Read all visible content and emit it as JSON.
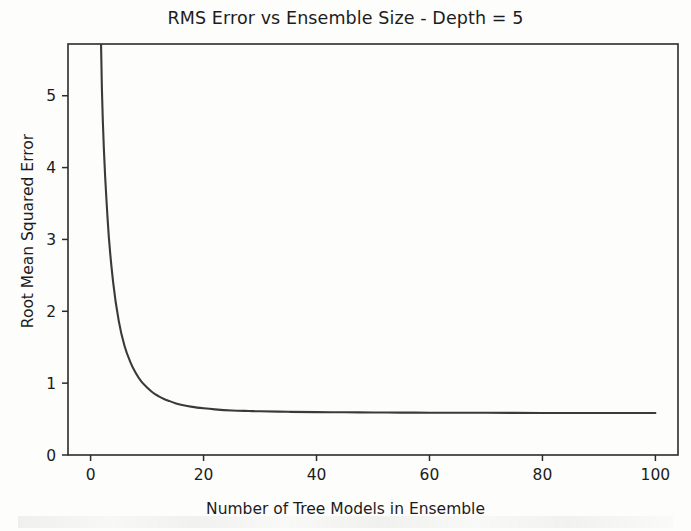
{
  "chart_data": {
    "type": "line",
    "title": "RMS Error vs Ensemble Size - Depth = 5",
    "xlabel": "Number of Tree Models in Ensemble",
    "ylabel": "Root Mean Squared Error",
    "xlim": [
      -4,
      104
    ],
    "ylim": [
      0,
      5.72
    ],
    "xticks": [
      0,
      20,
      40,
      60,
      80,
      100
    ],
    "xtick_labels": [
      "0",
      "20",
      "40",
      "60",
      "80",
      "100"
    ],
    "yticks": [
      0,
      1,
      2,
      3,
      4,
      5
    ],
    "ytick_labels": [
      "0",
      "1",
      "2",
      "3",
      "4",
      "5"
    ],
    "grid": false,
    "legend": null,
    "series": [
      {
        "name": "RMS Error",
        "color": "#3a3a3a",
        "linewidth": 2.1,
        "x": [
          1,
          2,
          3,
          4,
          5,
          6,
          7,
          8,
          9,
          10,
          11,
          12,
          13,
          14,
          15,
          16,
          18,
          20,
          22,
          25,
          28,
          30,
          35,
          40,
          45,
          50,
          55,
          60,
          65,
          70,
          75,
          80,
          85,
          90,
          95,
          100
        ],
        "y": [
          9.6,
          5.1,
          3.3,
          2.4,
          1.86,
          1.52,
          1.3,
          1.14,
          1.02,
          0.94,
          0.87,
          0.82,
          0.78,
          0.75,
          0.72,
          0.7,
          0.67,
          0.65,
          0.635,
          0.62,
          0.612,
          0.608,
          0.601,
          0.597,
          0.594,
          0.592,
          0.59,
          0.589,
          0.588,
          0.587,
          0.586,
          0.5855,
          0.585,
          0.5845,
          0.584,
          0.5835
        ]
      }
    ]
  },
  "axis_labels": {
    "title": "RMS Error vs Ensemble Size - Depth = 5",
    "x": "Number of Tree Models in Ensemble",
    "y": "Root Mean Squared Error"
  }
}
